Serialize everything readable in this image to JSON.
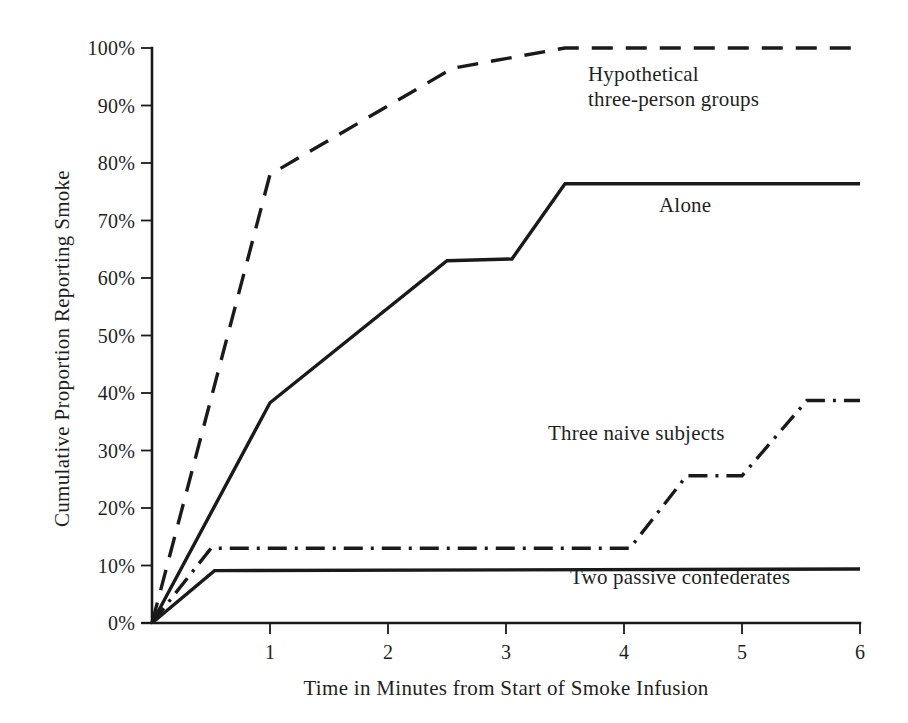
{
  "chart_data": {
    "type": "line",
    "title": "",
    "xlabel": "Time in Minutes from Start of Smoke Infusion",
    "ylabel": "Cumulative Proportion Reporting Smoke",
    "xlim": [
      0,
      6
    ],
    "ylim": [
      0,
      100
    ],
    "grid": false,
    "legend_position": "inline-annotations",
    "xticks": [
      "1",
      "2",
      "3",
      "4",
      "5",
      "6"
    ],
    "xtick_values": [
      1,
      2,
      3,
      4,
      5,
      6
    ],
    "yticks": [
      "0%",
      "10%",
      "20%",
      "30%",
      "40%",
      "50%",
      "60%",
      "70%",
      "80%",
      "90%",
      "100%"
    ],
    "ytick_values": [
      0,
      10,
      20,
      30,
      40,
      50,
      60,
      70,
      80,
      90,
      100
    ],
    "series": [
      {
        "name": "Hypothetical three-person groups",
        "style": "dashed",
        "color": "#1a1a1a",
        "label_lines": [
          "Hypothetical",
          "three-person groups"
        ],
        "x": [
          0,
          1,
          2.55,
          3.5,
          6
        ],
        "y": [
          0,
          78,
          96.5,
          100,
          100
        ]
      },
      {
        "name": "Alone",
        "style": "solid",
        "color": "#1a1a1a",
        "label_lines": [
          "Alone"
        ],
        "x": [
          0,
          1,
          2.5,
          3.05,
          3.5,
          6
        ],
        "y": [
          0,
          38.3,
          63,
          63.3,
          76.4,
          76.4
        ]
      },
      {
        "name": "Three naive subjects",
        "style": "dash-dot",
        "color": "#1a1a1a",
        "label_lines": [
          "Three naive subjects"
        ],
        "x": [
          0,
          0.5,
          4.05,
          4.53,
          5.0,
          5.55,
          6
        ],
        "y": [
          0,
          13,
          13,
          25.6,
          25.6,
          38.7,
          38.7
        ]
      },
      {
        "name": "Two passive confederates",
        "style": "solid",
        "color": "#1a1a1a",
        "label_lines": [
          "Two passive confederates"
        ],
        "x": [
          0,
          0.53,
          6
        ],
        "y": [
          0,
          9.1,
          9.4
        ]
      }
    ]
  },
  "axes": {
    "plot_left": 152,
    "plot_right": 860,
    "plot_top": 48,
    "plot_bottom": 623,
    "tick_length": 11,
    "axis_color": "#1a1a1a"
  }
}
